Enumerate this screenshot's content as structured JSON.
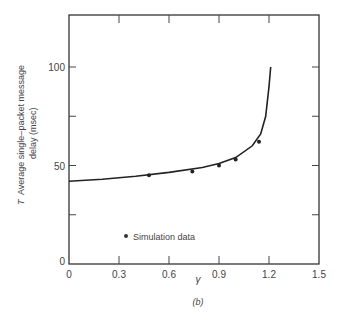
{
  "chart_data": {
    "type": "line",
    "title": "",
    "caption": "(b)",
    "xlabel": "γ",
    "ylabel_symbol": "T",
    "ylabel_line1": "Average single–packet message",
    "ylabel_line2": "delay (msec)",
    "xlim": [
      0,
      1.5
    ],
    "ylim": [
      0,
      125
    ],
    "x_ticks": [
      "0",
      "0.3",
      "0.6",
      "0.9",
      "1.2",
      "1.5"
    ],
    "y_ticks": [
      "0",
      "50",
      "100"
    ],
    "grid": false,
    "series": [
      {
        "name": "Analytical curve",
        "style": "line",
        "x": [
          0,
          0.2,
          0.4,
          0.6,
          0.8,
          0.9,
          1.0,
          1.1,
          1.15,
          1.18,
          1.2,
          1.21
        ],
        "y": [
          42,
          43,
          44.5,
          46.5,
          49,
          51,
          54,
          60,
          66,
          75,
          90,
          100
        ]
      },
      {
        "name": "Simulation data",
        "style": "points",
        "x": [
          0.48,
          0.74,
          0.9,
          1.0,
          1.14
        ],
        "y": [
          45,
          47,
          50,
          53,
          62
        ]
      }
    ],
    "legend": {
      "entries": [
        "Simulation data"
      ],
      "position": "lower-left inside"
    }
  }
}
